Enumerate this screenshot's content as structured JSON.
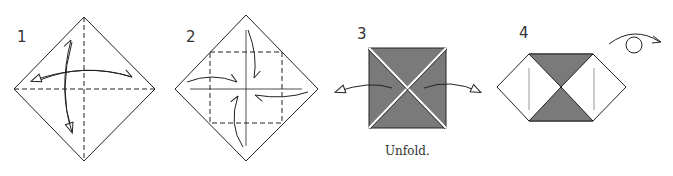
{
  "diagram": {
    "type": "origami-instructions",
    "steps": [
      {
        "number": "1",
        "description": "Square diamond with vertical and horizontal valley-fold creases; fold and unfold both ways",
        "arrows": [
          "fold-unfold-horizontal",
          "fold-unfold-vertical"
        ]
      },
      {
        "number": "2",
        "description": "Fold all four corners to the center (dashed square guide)",
        "arrows": [
          "top-corner-to-center",
          "bottom-corner-to-center",
          "left-corner-to-center",
          "right-corner-to-center"
        ]
      },
      {
        "number": "3",
        "description": "Blintzed square with shaded paper",
        "caption": "Unfold.",
        "arrows": [
          "unfold-left",
          "unfold-right"
        ]
      },
      {
        "number": "4",
        "description": "Hexagon shape with shaded top and bottom triangles",
        "symbol": "turn-over-icon"
      }
    ],
    "colors": {
      "line": "#222222",
      "shade": "#7a7a7a",
      "background": "#ffffff"
    }
  }
}
